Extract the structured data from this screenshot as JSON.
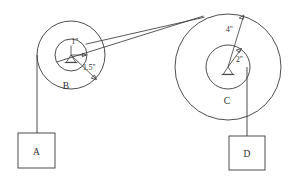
{
  "diagram": {
    "background_color": "#ffffff",
    "line_color": "#3a3a3a",
    "text_color": "#2b2b2b"
  },
  "pulleys": [
    {
      "id": "left",
      "center_label": "B",
      "center_x": 71,
      "center_y": 55,
      "outer_radius_px": 34,
      "inner_radius_px": 16,
      "inner_radius_label": "1\"",
      "outer_radius_label": "1.5\""
    },
    {
      "id": "right",
      "center_label": "C",
      "center_x": 228,
      "center_y": 67,
      "outer_radius_px": 53,
      "inner_radius_px": 22,
      "inner_radius_label": "2\"",
      "outer_radius_label": "4\""
    }
  ],
  "loads": [
    {
      "id": "load-a",
      "label": "A",
      "box_x": 18,
      "box_y": 133,
      "box_width": 37,
      "box_height": 35
    },
    {
      "id": "load-d",
      "label": "D",
      "box_x": 229,
      "box_y": 136,
      "box_width": 36,
      "box_height": 34
    }
  ],
  "belt": {
    "name": "connecting-belt",
    "from_x": 85,
    "from_y": 44,
    "to_x": 203,
    "to_y": 16
  }
}
